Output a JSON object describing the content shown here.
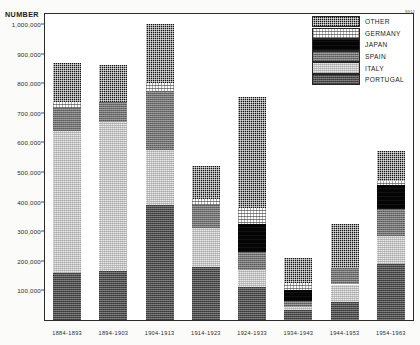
{
  "axis_title": "NUMBER",
  "corner_mark": "8912",
  "legend": {
    "items": [
      {
        "key": "other",
        "label": "OTHER"
      },
      {
        "key": "germany",
        "label": "GERMANY"
      },
      {
        "key": "japan",
        "label": "JAPAN"
      },
      {
        "key": "spain",
        "label": "SPAIN"
      },
      {
        "key": "italy",
        "label": "ITALY"
      },
      {
        "key": "portugal",
        "label": "PORTUGAL"
      }
    ]
  },
  "y_axis": {
    "ticks": [
      {
        "value": 1000000,
        "label": "1,000,000"
      },
      {
        "value": 900000,
        "label": "900,000"
      },
      {
        "value": 800000,
        "label": "800,000"
      },
      {
        "value": 700000,
        "label": "700,000"
      },
      {
        "value": 600000,
        "label": "600,000"
      },
      {
        "value": 500000,
        "label": "500,000"
      },
      {
        "value": 400000,
        "label": "400,000"
      },
      {
        "value": 300000,
        "label": "300,000"
      },
      {
        "value": 200000,
        "label": "200,000"
      },
      {
        "value": 100000,
        "label": "100,000"
      }
    ]
  },
  "chart_data": {
    "type": "bar",
    "stacked": true,
    "title": "",
    "xlabel": "",
    "ylabel": "NUMBER",
    "ylim": [
      0,
      1000000
    ],
    "grid": false,
    "legend_position": "top-right",
    "categories": [
      "1884-1893",
      "1894-1903",
      "1904-1913",
      "1914-1923",
      "1924-1933",
      "1934-1943",
      "1944-1953",
      "1954-1963"
    ],
    "stack_order_bottom_to_top": [
      "portugal",
      "italy",
      "spain",
      "japan",
      "germany",
      "other"
    ],
    "series": [
      {
        "name": "PORTUGAL",
        "key": "portugal",
        "color": "#4a4a4a",
        "values": [
          160000,
          165000,
          390000,
          180000,
          110000,
          35000,
          60000,
          190000
        ]
      },
      {
        "name": "ITALY",
        "key": "italy",
        "color": "#cfcfcf",
        "values": [
          480000,
          505000,
          185000,
          130000,
          60000,
          10000,
          60000,
          95000
        ]
      },
      {
        "name": "SPAIN",
        "key": "spain",
        "color": "#6e6e6e",
        "values": [
          75000,
          65000,
          200000,
          80000,
          60000,
          20000,
          55000,
          90000
        ]
      },
      {
        "name": "JAPAN",
        "key": "japan",
        "color": "#050505",
        "values": [
          0,
          0,
          0,
          0,
          95000,
          35000,
          0,
          80000
        ]
      },
      {
        "name": "GERMANY",
        "key": "germany",
        "color": "#fdfdfd",
        "values": [
          20000,
          0,
          25000,
          20000,
          55000,
          25000,
          0,
          15000
        ]
      },
      {
        "name": "OTHER",
        "key": "other",
        "color": "#141414",
        "values": [
          135000,
          125000,
          200000,
          110000,
          375000,
          85000,
          150000,
          100000
        ]
      }
    ],
    "totals": [
      870000,
      860000,
      1000000,
      520000,
      755000,
      210000,
      325000,
      570000
    ]
  }
}
